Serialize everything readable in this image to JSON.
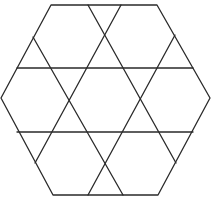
{
  "diagram": {
    "shape": "hexagon",
    "line_color": "#2a2a2a",
    "background": "#ffffff",
    "counts": {
      "outer_polygon_sides": 6,
      "horizontal_lines": 2,
      "diagonal_lines": 4
    }
  }
}
